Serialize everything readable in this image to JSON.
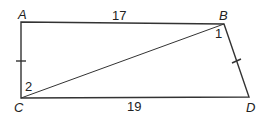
{
  "diagram": {
    "type": "quadrilateral-with-diagonal",
    "vertices": {
      "A": {
        "label": "A",
        "x": 21,
        "y": 22
      },
      "B": {
        "label": "B",
        "x": 224,
        "y": 24
      },
      "C": {
        "label": "C",
        "x": 21,
        "y": 98
      },
      "D": {
        "label": "D",
        "x": 249,
        "y": 97
      }
    },
    "sides": {
      "AB": {
        "length_label": "17"
      },
      "CD": {
        "length_label": "19"
      }
    },
    "angles": {
      "angle1": {
        "label": "1",
        "at": "B"
      },
      "angle2": {
        "label": "2",
        "at": "C"
      }
    },
    "congruent_marks": [
      "AC",
      "BD"
    ],
    "diagonal": "BC"
  }
}
